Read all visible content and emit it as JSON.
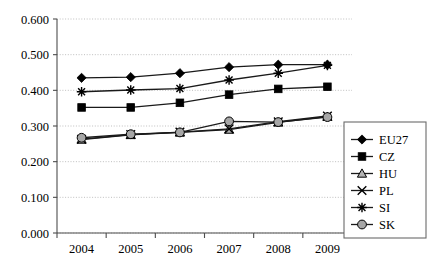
{
  "chart_data": {
    "type": "line",
    "title": "",
    "subtitle": "",
    "xlabel": "",
    "ylabel": "",
    "categories": [
      "2004",
      "2005",
      "2006",
      "2007",
      "2008",
      "2009"
    ],
    "x_tick_labels": [
      "2004",
      "2005",
      "2006",
      "2007",
      "2008",
      "2009"
    ],
    "y_tick_labels": [
      "0.000",
      "0.100",
      "0.200",
      "0.300",
      "0.400",
      "0.500",
      "0.600"
    ],
    "y_tick_values": [
      0.0,
      0.1,
      0.2,
      0.3,
      0.4,
      0.5,
      0.6
    ],
    "ylim": [
      0.0,
      0.6
    ],
    "grid": "horizontal-dotted",
    "legend_position": "right-inside-bottom",
    "series": [
      {
        "name": "EU27",
        "marker": "filled-diamond",
        "values": [
          0.435,
          0.437,
          0.448,
          0.465,
          0.472,
          0.472
        ]
      },
      {
        "name": "CZ",
        "marker": "filled-square",
        "values": [
          0.352,
          0.352,
          0.365,
          0.388,
          0.404,
          0.41
        ]
      },
      {
        "name": "HU",
        "marker": "open-triangle",
        "values": [
          0.262,
          0.275,
          0.282,
          0.29,
          0.31,
          0.326
        ]
      },
      {
        "name": "PL",
        "marker": "cross-x",
        "values": [
          0.263,
          0.276,
          0.283,
          0.292,
          0.312,
          0.328
        ]
      },
      {
        "name": "SI",
        "marker": "asterisk",
        "values": [
          0.396,
          0.401,
          0.405,
          0.429,
          0.448,
          0.47
        ]
      },
      {
        "name": "SK",
        "marker": "gray-circle",
        "values": [
          0.267,
          0.277,
          0.282,
          0.313,
          0.311,
          0.325
        ]
      }
    ],
    "colors": {
      "axis": "#4d4d4d",
      "grid": "#b8b8b8",
      "line": "#1a1a1a",
      "marker_fill": "#000000",
      "marker_gray": "#a6a6a6",
      "legend_border": "#6b6b6b",
      "background": "#ffffff"
    }
  },
  "legend": {
    "items": [
      {
        "label": "EU27"
      },
      {
        "label": "CZ"
      },
      {
        "label": "HU"
      },
      {
        "label": "PL"
      },
      {
        "label": "SI"
      },
      {
        "label": "SK"
      }
    ]
  }
}
